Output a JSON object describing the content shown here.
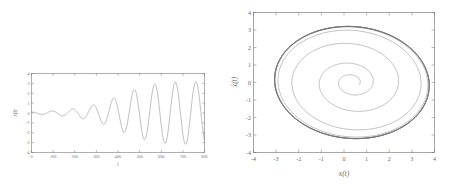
{
  "figure": {
    "caption": "",
    "panels": [
      "time-series",
      "phase-portrait"
    ]
  },
  "chart_data": [
    {
      "id": "time-series",
      "type": "line",
      "title": "",
      "xlabel": "t",
      "ylabel": "x(t)",
      "xlim": [
        0,
        800
      ],
      "ylim": [
        -4,
        4
      ],
      "xticks": [
        0,
        100,
        200,
        300,
        400,
        500,
        600,
        700,
        800
      ],
      "xticklabels": [
        "0",
        "100",
        "200",
        "300",
        "400",
        "500",
        "600",
        "700",
        "800"
      ],
      "yticks": [
        -4,
        -3,
        -2,
        -1,
        0,
        1,
        2,
        3,
        4
      ],
      "yticklabels": [
        "-4",
        "-3",
        "-2",
        "-1",
        "0",
        "1",
        "2",
        "3",
        "4"
      ],
      "grid": false,
      "legend": null,
      "series": [
        {
          "name": "x(t)",
          "color": "#76767a",
          "description": "Self-excited oscillation growing from small initial amplitude toward a steady limit-cycle amplitude of about 3.2",
          "model": {
            "form": "amplitude-modulated oscillation",
            "initial_value": 0.1,
            "saturation_amplitude": 3.2,
            "growth_rate": 0.0075,
            "period": 95,
            "phase": 0
          },
          "x": [
            0,
            20,
            40,
            50,
            60,
            80,
            100,
            110,
            125,
            150,
            160,
            175,
            200,
            210,
            225,
            250,
            260,
            270,
            300,
            310,
            320,
            350,
            360,
            370,
            400,
            410,
            420,
            450,
            460,
            470,
            500,
            510,
            520,
            550,
            560,
            570,
            600,
            610,
            620,
            650,
            660,
            670,
            700,
            710,
            720,
            750,
            760,
            770,
            790,
            800
          ],
          "y": [
            0.1,
            0.35,
            1.0,
            1.25,
            1.2,
            0.3,
            -1.05,
            -1.4,
            -1.2,
            0.55,
            1.75,
            2.25,
            0.9,
            -0.6,
            -2.0,
            -0.8,
            0.9,
            2.15,
            2.35,
            1.2,
            -0.6,
            -2.5,
            -1.9,
            -0.1,
            2.05,
            2.7,
            2.3,
            -0.5,
            -2.2,
            -2.85,
            -1.1,
            0.9,
            2.55,
            2.85,
            1.8,
            -0.5,
            -2.6,
            -3.05,
            -1.7,
            1.35,
            2.85,
            3.1,
            2.0,
            0.2,
            -2.2,
            -3.1,
            -2.6,
            -0.5,
            2.4,
            3.15
          ]
        }
      ]
    },
    {
      "id": "phase-portrait",
      "type": "line",
      "title": "",
      "xlabel": "x(t)",
      "ylabel": "ẋ(t)",
      "xlim": [
        -4,
        4
      ],
      "ylim": [
        -4,
        4
      ],
      "xticks": [
        -4,
        -3,
        -2,
        -1,
        0,
        1,
        2,
        3,
        4
      ],
      "xticklabels": [
        "-4",
        "-3",
        "-2",
        "-1",
        "0",
        "1",
        "2",
        "3",
        "4"
      ],
      "yticks": [
        -4,
        -3,
        -2,
        -1,
        0,
        1,
        2,
        3,
        4
      ],
      "yticklabels": [
        "-4",
        "-3",
        "-2",
        "-1",
        "0",
        "1",
        "2",
        "3",
        "4"
      ],
      "grid": false,
      "legend": null,
      "series": [
        {
          "name": "trajectory",
          "color": "#757579",
          "description": "Unstable-focus spiral starting near the origin and winding outward onto a thick limit-cycle band; the trajectory is tilted, elongated along the diagonal",
          "model": {
            "form": "outward spiral to limit cycle",
            "start_radius": 0.35,
            "limit_radius": 3.45,
            "rotation_deg": -20,
            "aspect_ratio": 0.92,
            "turns": 11,
            "growth_rate": 0.31,
            "center": [
              0.35,
              0.0
            ]
          }
        }
      ]
    }
  ]
}
